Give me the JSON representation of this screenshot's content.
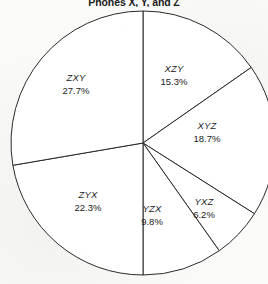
{
  "chart_data": {
    "type": "pie",
    "title": "Phones X, Y, and Z",
    "xlabel": "",
    "ylabel": "",
    "grid": false,
    "legend_position": "none",
    "label_mode": "inside-slice",
    "start_angle_deg": 0,
    "direction": "clockwise",
    "total": "100.0%",
    "categories": [
      "XZY",
      "XYZ",
      "YXZ",
      "YZX",
      "ZYX",
      "ZXY"
    ],
    "values": [
      15.3,
      18.7,
      6.2,
      9.8,
      22.3,
      27.7
    ],
    "value_labels": [
      "15.3%",
      "18.7%",
      "6.2%",
      "9.8%",
      "22.3%",
      "27.7%"
    ],
    "slices": [
      {
        "label": "XZY",
        "value": 15.3,
        "value_label": "15.3%",
        "label_x": 174,
        "label_y": 63
      },
      {
        "label": "XYZ",
        "value": 18.7,
        "value_label": "18.7%",
        "label_x": 207,
        "label_y": 120
      },
      {
        "label": "YXZ",
        "value": 6.2,
        "value_label": "6.2%",
        "label_x": 204,
        "label_y": 196
      },
      {
        "label": "YZX",
        "value": 9.8,
        "value_label": "9.8%",
        "label_x": 152,
        "label_y": 203
      },
      {
        "label": "ZYX",
        "value": 22.3,
        "value_label": "22.3%",
        "label_x": 88,
        "label_y": 189
      },
      {
        "label": "ZXY",
        "value": 27.7,
        "value_label": "27.7%",
        "label_x": 76,
        "label_y": 72
      }
    ],
    "style": {
      "fill": "#ffffff",
      "stroke": "#2a2a2a",
      "stroke_width": 1
    }
  }
}
